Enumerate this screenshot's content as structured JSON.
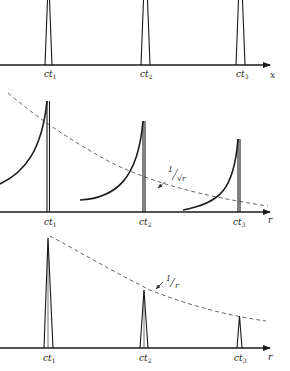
{
  "figure": {
    "panels": [
      {
        "id": "top",
        "description": "Delta-like pulses on x axis",
        "axis_label": "x",
        "tick_labels": [
          {
            "base": "ct",
            "sub": "1"
          },
          {
            "base": "ct",
            "sub": "2"
          },
          {
            "base": "ct",
            "sub": "3"
          }
        ]
      },
      {
        "id": "middle",
        "description": "Pulses with trailing wakes decaying as 1/sqrt(r)",
        "axis_label": "r",
        "envelope_label": {
          "num": "1",
          "den": "√r"
        },
        "tick_labels": [
          {
            "base": "ct",
            "sub": "1"
          },
          {
            "base": "ct",
            "sub": "2"
          },
          {
            "base": "ct",
            "sub": "3"
          }
        ]
      },
      {
        "id": "bottom",
        "description": "Sharp pulses decaying as 1/r",
        "axis_label": "r",
        "envelope_label": {
          "num": "1",
          "den": "r"
        },
        "tick_labels": [
          {
            "base": "ct",
            "sub": "1"
          },
          {
            "base": "ct",
            "sub": "2"
          },
          {
            "base": "ct",
            "sub": "3"
          }
        ]
      }
    ],
    "colors": {
      "ink": "#1a1a1a",
      "dashed": "#555555",
      "background": "#ffffff"
    }
  }
}
